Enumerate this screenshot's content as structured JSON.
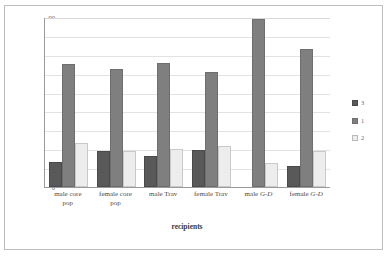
{
  "chart_data": {
    "type": "bar",
    "title": "",
    "subtitle": "",
    "xlabel": "recipients",
    "ylabel": "percentage of pairs",
    "ylim": [
      0,
      90
    ],
    "ytick_step": 10,
    "yticks": [
      "0",
      "10",
      "20",
      "30",
      "40",
      "50",
      "60",
      "70",
      "80",
      "90"
    ],
    "grid": true,
    "legend_position": "right",
    "categories": [
      "male core pop",
      "female core pop",
      "male Trav",
      "female Trav",
      "male G-D",
      "female G-D"
    ],
    "category_parts": [
      {
        "line1": "male core",
        "line2": "pop",
        "italic": ""
      },
      {
        "line1": "female core",
        "line2": "pop",
        "italic": ""
      },
      {
        "line1": "male Trav",
        "line2": "",
        "italic": ""
      },
      {
        "line1": "female Trav",
        "line2": "",
        "italic": ""
      },
      {
        "line1": "male ",
        "line2": "",
        "italic": "G-D"
      },
      {
        "line1": "female ",
        "line2": "",
        "italic": "G-D"
      }
    ],
    "series": [
      {
        "name": "3",
        "color": "#595959",
        "values": [
          13,
          19,
          16.5,
          19.5,
          0,
          11
        ]
      },
      {
        "name": "1",
        "color": "#7f7f7f",
        "values": [
          65,
          62.5,
          65.5,
          61,
          89,
          73
        ]
      },
      {
        "name": "2",
        "color": "#ededed",
        "values": [
          23.5,
          19,
          20,
          21.5,
          12.5,
          19
        ]
      }
    ]
  },
  "legend": {
    "items": [
      {
        "label": "3"
      },
      {
        "label": "1"
      },
      {
        "label": "2"
      }
    ]
  },
  "colors": {
    "series_dark": "#595959",
    "series_medium": "#7f7f7f",
    "series_light": "#ededed",
    "gridline": "#e2e2e2",
    "axis": "#9a9a9a",
    "frame": "#bdbdbd",
    "text": "#4a4a4a",
    "background": "#ffffff"
  }
}
